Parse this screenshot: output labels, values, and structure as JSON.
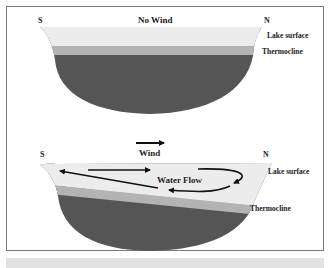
{
  "top_diagram": {
    "title": "No Wind",
    "south_label": "S",
    "north_label": "N",
    "lake_surface_label": "Lake surface",
    "thermocline_label": "Thermocline"
  },
  "bottom_diagram": {
    "wind_label": "Wind",
    "south_label": "S",
    "north_label": "N",
    "lake_surface_label": "Lake surface",
    "thermocline_label": "Thermocline",
    "water_flow_label": "Water Flow"
  },
  "colors": {
    "surface_water": "#ececec",
    "thermocline": "#b3b3b3",
    "deep_water": "#555555",
    "frame": "#7a7a7a",
    "arrow": "#111111"
  }
}
